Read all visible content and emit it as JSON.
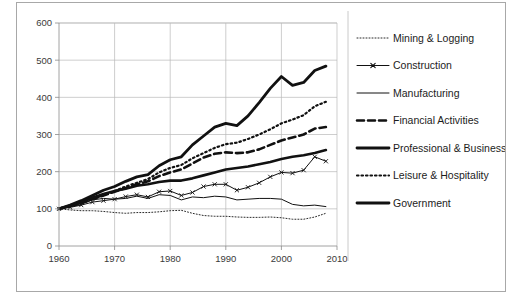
{
  "chart_data": {
    "type": "line",
    "title": "",
    "subtitle": "",
    "xlabel": "",
    "ylabel": "",
    "xlim": [
      1960,
      2010
    ],
    "ylim": [
      0,
      600
    ],
    "ytick_values": [
      0,
      100,
      200,
      300,
      400,
      500,
      600
    ],
    "ytick_labels": [
      "0",
      "100",
      "200",
      "300",
      "400",
      "500",
      "600"
    ],
    "xtick_values": [
      1960,
      1970,
      1980,
      1990,
      2000,
      2010
    ],
    "xtick_labels": [
      "1960",
      "1970",
      "1980",
      "1990",
      "2000",
      "2010"
    ],
    "grid": true,
    "grid_axis": "both",
    "legend_position": "right",
    "index_base_value": 100,
    "index_base_year": 1960,
    "x": [
      1960,
      1962,
      1964,
      1966,
      1968,
      1970,
      1972,
      1974,
      1976,
      1978,
      1980,
      1982,
      1984,
      1986,
      1988,
      1990,
      1992,
      1994,
      1996,
      1998,
      2000,
      2002,
      2004,
      2006,
      2008
    ],
    "series": [
      {
        "name": "Mining & Logging",
        "style": "fine-dotted",
        "stroke_width": 0.9,
        "dash": "1,2",
        "marker": "none",
        "values": [
          100,
          97,
          95,
          95,
          93,
          90,
          88,
          90,
          90,
          92,
          95,
          96,
          88,
          82,
          80,
          80,
          78,
          77,
          77,
          78,
          76,
          72,
          72,
          78,
          88
        ]
      },
      {
        "name": "Construction",
        "style": "thin-line-marker",
        "stroke_width": 1.0,
        "dash": "none",
        "marker": "x",
        "values": [
          100,
          104,
          110,
          118,
          122,
          126,
          133,
          138,
          132,
          146,
          148,
          136,
          144,
          160,
          166,
          166,
          150,
          158,
          170,
          186,
          198,
          196,
          204,
          240,
          228
        ]
      },
      {
        "name": "Manufacturing",
        "style": "thin-line",
        "stroke_width": 1.0,
        "dash": "none",
        "marker": "none",
        "values": [
          100,
          106,
          112,
          124,
          128,
          126,
          128,
          134,
          128,
          138,
          136,
          124,
          132,
          130,
          134,
          132,
          124,
          126,
          128,
          128,
          126,
          112,
          108,
          110,
          106
        ]
      },
      {
        "name": "Financial Activities",
        "style": "thick-dashed",
        "stroke_width": 2.6,
        "dash": "7,4",
        "marker": "none",
        "values": [
          100,
          108,
          116,
          126,
          136,
          146,
          156,
          166,
          174,
          188,
          198,
          206,
          222,
          238,
          248,
          252,
          250,
          252,
          260,
          272,
          284,
          292,
          300,
          316,
          320
        ]
      },
      {
        "name": "Professional & Business",
        "style": "thick-line",
        "stroke_width": 2.8,
        "dash": "none",
        "marker": "none",
        "values": [
          100,
          110,
          122,
          136,
          150,
          160,
          174,
          186,
          192,
          216,
          232,
          240,
          272,
          296,
          320,
          330,
          324,
          350,
          386,
          424,
          456,
          432,
          440,
          472,
          484
        ]
      },
      {
        "name": "Leisure & Hospitality",
        "style": "thick-dotted",
        "stroke_width": 2.2,
        "dash": "1.5,3",
        "marker": "none",
        "values": [
          100,
          107,
          115,
          126,
          137,
          148,
          160,
          170,
          180,
          198,
          210,
          218,
          236,
          250,
          264,
          274,
          278,
          288,
          300,
          314,
          330,
          340,
          352,
          376,
          388
        ]
      },
      {
        "name": "Government",
        "style": "thick-line",
        "stroke_width": 2.6,
        "dash": "none",
        "marker": "none",
        "values": [
          100,
          108,
          118,
          130,
          140,
          148,
          154,
          162,
          166,
          172,
          176,
          176,
          182,
          190,
          198,
          206,
          210,
          214,
          220,
          226,
          234,
          240,
          244,
          250,
          258
        ]
      }
    ]
  },
  "legend": {
    "items": [
      {
        "label": "Mining & Logging",
        "swatch": "fine-dotted"
      },
      {
        "label": "Construction",
        "swatch": "thin-line-marker"
      },
      {
        "label": "Manufacturing",
        "swatch": "thin-line"
      },
      {
        "label": "Financial Activities",
        "swatch": "thick-dashed"
      },
      {
        "label": "Professional & Business",
        "swatch": "thick-line"
      },
      {
        "label": "Leisure & Hospitality",
        "swatch": "thick-dotted"
      },
      {
        "label": "Government",
        "swatch": "thick-line"
      }
    ]
  },
  "colors": {
    "line": "#111111",
    "grid": "#b9b9b9",
    "axis": "#8a8a8a",
    "text": "#3a3a3a",
    "frame": "#a8a8a8",
    "background": "#ffffff"
  }
}
